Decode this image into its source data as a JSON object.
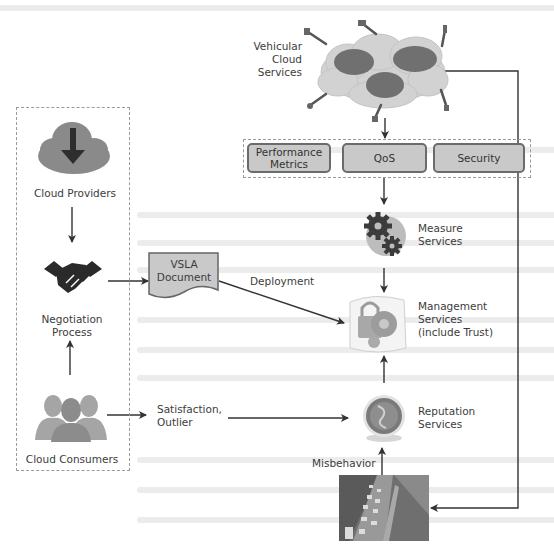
{
  "diagram": {
    "vehicular_cloud": {
      "label_lines": [
        "Vehicular",
        "Cloud",
        "Services"
      ]
    },
    "metrics_group": {
      "items": [
        {
          "label": "Performance Metrics"
        },
        {
          "label": "QoS"
        },
        {
          "label": "Security"
        }
      ]
    },
    "left_group": {
      "providers": {
        "label": "Cloud Providers",
        "icon": "cloud-download-icon"
      },
      "negotiation": {
        "label_line1": "Negotiation",
        "label_line2": "Process",
        "icon": "handshake-icon"
      },
      "consumers": {
        "label": "Cloud Consumers",
        "icon": "users-icon"
      }
    },
    "vsla": {
      "line1": "VSLA",
      "line2": "Document"
    },
    "edges": {
      "deployment": "Deployment",
      "satisfaction_line1": "Satisfaction,",
      "satisfaction_line2": "Outlier",
      "misbehavior": "Misbehavior"
    },
    "measure": {
      "line1": "Measure",
      "line2": "Services",
      "icon": "gears-icon"
    },
    "management": {
      "line1": "Management",
      "line2": "Services",
      "line3": "(include Trust)",
      "icon": "lock-gear-icon"
    },
    "reputation": {
      "line1": "Reputation",
      "line2": "Services",
      "icon": "reputation-globe-icon"
    },
    "traffic": {
      "icon": "traffic-photo"
    },
    "colors": {
      "line": "#333333",
      "box_fill": "#c9c9c9",
      "box_border": "#6b6b6b",
      "cloud_gray": "#8a8a8a",
      "vc_light": "#d0d0d0",
      "vc_dark": "#6e6e6e"
    }
  }
}
